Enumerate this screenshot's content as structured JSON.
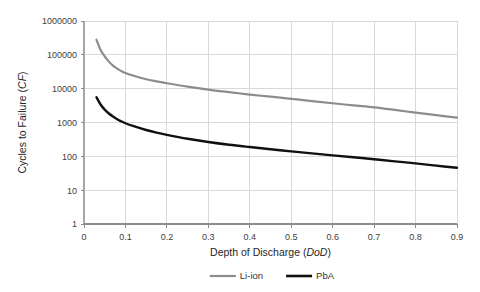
{
  "chart_data": {
    "type": "line",
    "title": "",
    "xlabel": "Depth of Discharge (DoD)",
    "xlabel_plain": "Depth of Discharge",
    "xlabel_italic": "DoD",
    "ylabel": "Cycles to Failure (CF)",
    "ylabel_plain": "Cycles to Failure",
    "ylabel_italic": "CF",
    "yscale": "log",
    "xlim": [
      0,
      0.9
    ],
    "ylim": [
      1,
      1000000
    ],
    "grid": true,
    "legend_position": "bottom",
    "xticks": [
      "0",
      "0.1",
      "0.2",
      "0.3",
      "0.4",
      "0.5",
      "0.6",
      "0.7",
      "0.8",
      "0.9"
    ],
    "xtick_values": [
      0,
      0.1,
      0.2,
      0.3,
      0.4,
      0.5,
      0.6,
      0.7,
      0.8,
      0.9
    ],
    "yticks": [
      "1",
      "10",
      "100",
      "1000",
      "10000",
      "100000",
      "1000000"
    ],
    "ytick_values": [
      1,
      10,
      100,
      1000,
      10000,
      100000,
      1000000
    ],
    "x": [
      0.03,
      0.04,
      0.05,
      0.06,
      0.07,
      0.08,
      0.09,
      0.1,
      0.12,
      0.15,
      0.175,
      0.2,
      0.25,
      0.3,
      0.35,
      0.4,
      0.45,
      0.5,
      0.55,
      0.6,
      0.65,
      0.7,
      0.75,
      0.8,
      0.85,
      0.9
    ],
    "series": [
      {
        "name": "Li-ion",
        "color": "#8c8c8c",
        "width": 2.2,
        "values": [
          280000,
          140000,
          90000,
          63000,
          48000,
          39000,
          33000,
          29000,
          24000,
          19000,
          16500,
          14500,
          11500,
          9400,
          7900,
          6700,
          5800,
          5000,
          4300,
          3700,
          3200,
          2800,
          2350,
          1950,
          1650,
          1400
        ]
      },
      {
        "name": "PbA",
        "color": "#101010",
        "width": 2.4,
        "values": [
          5600,
          3400,
          2400,
          1850,
          1500,
          1250,
          1080,
          950,
          780,
          600,
          500,
          430,
          330,
          265,
          220,
          188,
          162,
          140,
          122,
          107,
          94,
          82,
          71,
          62,
          53,
          46
        ]
      }
    ],
    "legend": [
      {
        "label": "Li-ion",
        "color": "#8c8c8c",
        "width": 2.2
      },
      {
        "label": "PbA",
        "color": "#101010",
        "width": 2.6
      }
    ]
  },
  "colors": {
    "li_ion": "#8c8c8c",
    "pba": "#101010",
    "grid": "#d9d9d9",
    "axis": "#a6a6a6",
    "background": "#ffffff",
    "text": "#333333"
  }
}
